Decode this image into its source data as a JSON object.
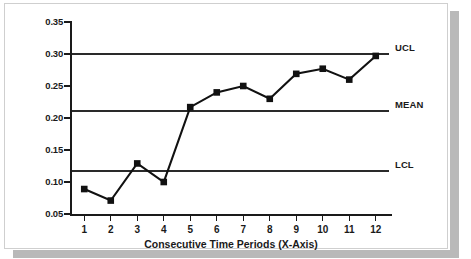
{
  "chart_data": {
    "type": "line",
    "title": "",
    "xlabel": "Consecutive Time Periods (X-Axis)",
    "ylabel": "Proportion/Rate (Y-Axis)",
    "categories": [
      "1",
      "2",
      "3",
      "4",
      "5",
      "6",
      "7",
      "8",
      "9",
      "10",
      "11",
      "12"
    ],
    "x": [
      1,
      2,
      3,
      4,
      5,
      6,
      7,
      8,
      9,
      10,
      11,
      12
    ],
    "series": [
      {
        "name": "observed-rate",
        "values": [
          0.089,
          0.071,
          0.129,
          0.1,
          0.217,
          0.24,
          0.25,
          0.23,
          0.269,
          0.277,
          0.26,
          0.297
        ],
        "marker": "square",
        "color": "#111111"
      }
    ],
    "reference_lines": [
      {
        "label": "UCL",
        "value": 0.3,
        "color": "#2a2a2a"
      },
      {
        "label": "MEAN",
        "value": 0.211,
        "color": "#2a2a2a"
      },
      {
        "label": "LCL",
        "value": 0.117,
        "color": "#2a2a2a"
      }
    ],
    "ylim": [
      0.05,
      0.35
    ],
    "yticks": [
      0.05,
      0.1,
      0.15,
      0.2,
      0.25,
      0.3,
      0.35
    ],
    "ytick_labels": [
      "0.05",
      "0.10",
      "0.15",
      "0.20",
      "0.25",
      "0.30",
      "0.35"
    ],
    "xlim": [
      0.5,
      12.5
    ],
    "grid": false,
    "legend": "none"
  }
}
